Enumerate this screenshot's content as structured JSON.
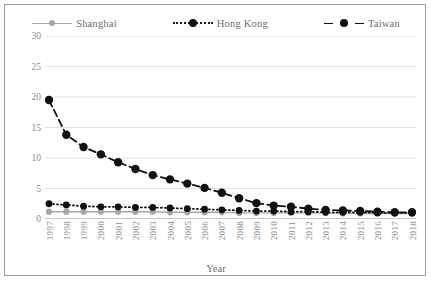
{
  "chart_data": {
    "type": "line",
    "title": "",
    "xlabel": "Year",
    "ylabel": "",
    "ylim": [
      0,
      30
    ],
    "yticks": [
      0,
      5,
      10,
      15,
      20,
      25,
      30
    ],
    "grid": true,
    "legend_position": "top",
    "categories": [
      "1997",
      "1998",
      "1999",
      "2000",
      "2001",
      "2002",
      "2003",
      "2004",
      "2005",
      "2006",
      "2007",
      "2008",
      "2009",
      "2010",
      "2011",
      "2012",
      "2013",
      "2014",
      "2015",
      "2016",
      "2017",
      "2018"
    ],
    "series": [
      {
        "name": "Shanghai",
        "color": "#a6a6a6",
        "line_style": "solid",
        "marker": "circle",
        "values": [
          1.2,
          1.2,
          1.2,
          1.2,
          1.2,
          1.2,
          1.2,
          1.1,
          1.1,
          1.1,
          1.1,
          1.0,
          1.0,
          1.0,
          1.0,
          1.0,
          1.0,
          0.9,
          0.9,
          0.9,
          0.9,
          0.9
        ]
      },
      {
        "name": "Hong Kong",
        "color": "#111111",
        "line_style": "dotted",
        "marker": "circle",
        "values": [
          2.5,
          2.3,
          2.1,
          2.0,
          2.0,
          1.9,
          1.9,
          1.8,
          1.7,
          1.6,
          1.5,
          1.4,
          1.3,
          1.3,
          1.2,
          1.2,
          1.1,
          1.1,
          1.1,
          1.0,
          1.0,
          1.0
        ]
      },
      {
        "name": "Taiwan",
        "color": "#111111",
        "line_style": "dashed",
        "marker": "circle",
        "values": [
          19.5,
          13.8,
          11.8,
          10.6,
          9.3,
          8.2,
          7.2,
          6.5,
          5.8,
          5.1,
          4.3,
          3.4,
          2.6,
          2.2,
          2.0,
          1.7,
          1.5,
          1.4,
          1.3,
          1.2,
          1.1,
          1.1
        ]
      }
    ]
  }
}
